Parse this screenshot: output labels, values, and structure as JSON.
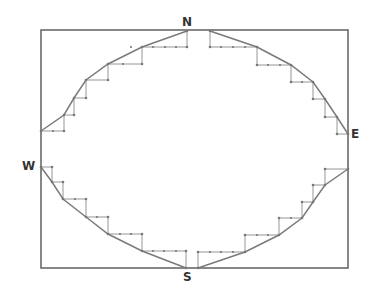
{
  "diagram": {
    "type": "staircase-approximated-ellipse",
    "labels": {
      "north": "N",
      "east": "E",
      "south": "S",
      "west": "W"
    },
    "colors": {
      "frame": "#6a6a6a",
      "curve": "#7a7a7a",
      "steps": "#8a8a8a",
      "dots": "#777777",
      "label": "#333333"
    },
    "frame": {
      "x": 41,
      "y": 30,
      "width": 307,
      "height": 238
    },
    "curves": [
      [
        [
          41,
          131
        ],
        [
          64,
          115
        ],
        [
          74,
          98
        ],
        [
          86,
          80
        ],
        [
          108,
          64
        ],
        [
          142,
          47
        ],
        [
          187,
          31
        ]
      ],
      [
        [
          210,
          31
        ],
        [
          257,
          47
        ],
        [
          291,
          65
        ],
        [
          313,
          82
        ],
        [
          325,
          99
        ],
        [
          337,
          117
        ],
        [
          348,
          134
        ]
      ],
      [
        [
          41,
          167
        ],
        [
          52,
          182
        ],
        [
          63,
          199
        ],
        [
          86,
          217
        ],
        [
          108,
          234
        ],
        [
          142,
          251
        ],
        [
          186,
          268
        ]
      ],
      [
        [
          198,
          268
        ],
        [
          245,
          252
        ],
        [
          279,
          235
        ],
        [
          302,
          218
        ],
        [
          313,
          202
        ],
        [
          325,
          185
        ],
        [
          348,
          169
        ]
      ]
    ],
    "steps": [
      [
        [
          41,
          131
        ],
        [
          64,
          131
        ],
        [
          64,
          115
        ],
        [
          74,
          115
        ],
        [
          74,
          98
        ],
        [
          86,
          98
        ],
        [
          86,
          80
        ],
        [
          108,
          80
        ],
        [
          108,
          64
        ],
        [
          142,
          64
        ],
        [
          142,
          47
        ],
        [
          187,
          47
        ],
        [
          187,
          31
        ]
      ],
      [
        [
          210,
          31
        ],
        [
          210,
          47
        ],
        [
          257,
          47
        ],
        [
          257,
          65
        ],
        [
          291,
          65
        ],
        [
          291,
          82
        ],
        [
          313,
          82
        ],
        [
          313,
          99
        ],
        [
          325,
          99
        ],
        [
          325,
          117
        ],
        [
          337,
          117
        ],
        [
          337,
          134
        ],
        [
          348,
          134
        ]
      ],
      [
        [
          41,
          167
        ],
        [
          52,
          167
        ],
        [
          52,
          182
        ],
        [
          63,
          182
        ],
        [
          63,
          199
        ],
        [
          86,
          199
        ],
        [
          86,
          217
        ],
        [
          108,
          217
        ],
        [
          108,
          234
        ],
        [
          142,
          234
        ],
        [
          142,
          251
        ],
        [
          186,
          251
        ],
        [
          186,
          268
        ]
      ],
      [
        [
          198,
          268
        ],
        [
          198,
          252
        ],
        [
          245,
          252
        ],
        [
          245,
          235
        ],
        [
          279,
          235
        ],
        [
          279,
          218
        ],
        [
          302,
          218
        ],
        [
          302,
          202
        ],
        [
          313,
          202
        ],
        [
          313,
          185
        ],
        [
          325,
          185
        ],
        [
          325,
          169
        ],
        [
          348,
          169
        ]
      ]
    ],
    "tick_dots": [
      [
        53,
        131
      ],
      [
        123,
        64
      ],
      [
        131,
        47
      ],
      [
        153,
        47
      ],
      [
        165,
        47
      ],
      [
        176,
        47
      ],
      [
        221,
        47
      ],
      [
        233,
        47
      ],
      [
        245,
        47
      ],
      [
        268,
        65
      ],
      [
        280,
        65
      ],
      [
        302,
        82
      ],
      [
        75,
        199
      ],
      [
        97,
        217
      ],
      [
        120,
        234
      ],
      [
        131,
        234
      ],
      [
        153,
        251
      ],
      [
        164,
        251
      ],
      [
        176,
        251
      ],
      [
        210,
        252
      ],
      [
        221,
        252
      ],
      [
        233,
        252
      ],
      [
        257,
        235
      ],
      [
        268,
        235
      ],
      [
        291,
        218
      ]
    ]
  }
}
